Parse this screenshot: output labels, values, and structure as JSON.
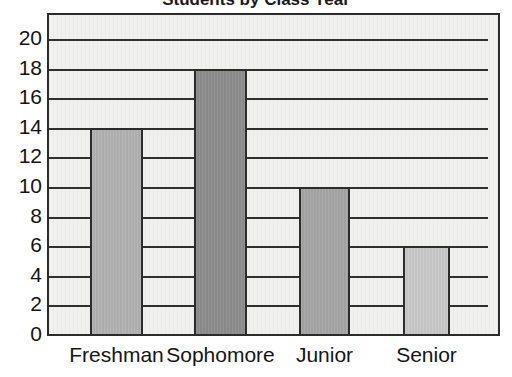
{
  "chart_data": {
    "type": "bar",
    "title": "",
    "xlabel": "",
    "ylabel": "",
    "categories": [
      "Freshman",
      "Sophomore",
      "Junior",
      "Senior"
    ],
    "values": [
      14,
      18,
      10,
      6
    ],
    "series": [
      {
        "name": "Students",
        "values": [
          14,
          18,
          10,
          6
        ]
      }
    ],
    "ylim": [
      0,
      20
    ],
    "ytick_step": 2,
    "yticks": [
      20,
      18,
      16,
      14,
      12,
      10,
      8,
      6,
      4,
      2,
      0
    ],
    "ytick_labels": [
      "20",
      "18",
      "16",
      "14",
      "12",
      "10",
      "8",
      "6",
      "4",
      "2",
      "0"
    ],
    "grid": true,
    "grid_axis": "y",
    "legend": false,
    "legend_position": "none",
    "bar_colors": [
      "#b2b2b2",
      "#8d8d8d",
      "#a6a6a6",
      "#c9c9c9"
    ],
    "bar_edge_color": "#2b2b2b",
    "plot_background": "#f0f0ef",
    "axis_color": "#2b2b2b",
    "text_color": "#141414",
    "annotations": []
  },
  "figure": {
    "title_clipped": "Students by Class Year",
    "background": "#ffffff"
  }
}
